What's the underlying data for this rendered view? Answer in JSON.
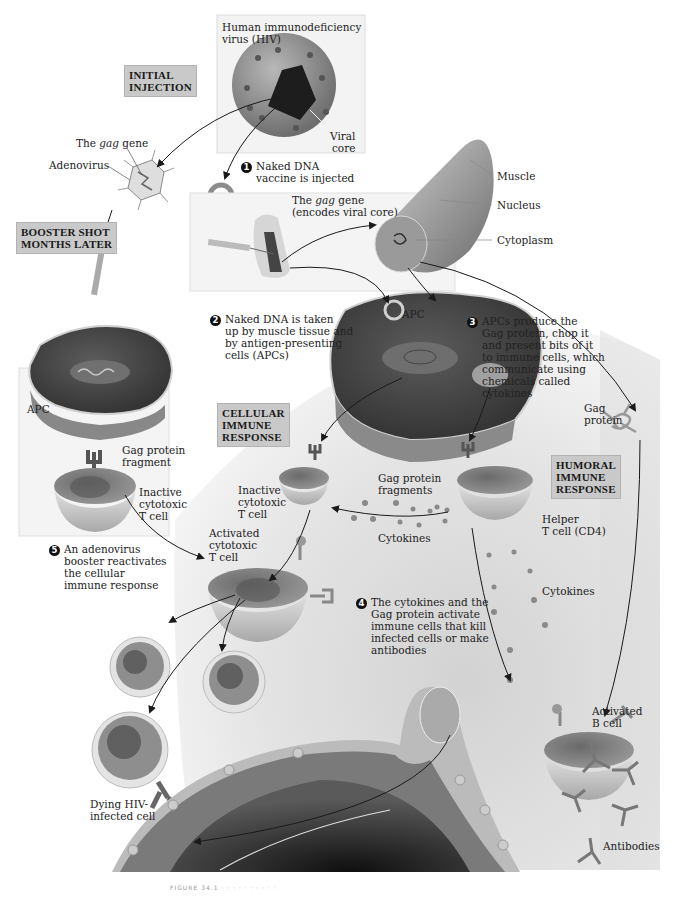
{
  "figure": {
    "stage_boxes": {
      "initial_injection": "INITIAL\nINJECTION",
      "booster_shot": "BOOSTER SHOT\nMONTHS LATER",
      "cellular_response": "CELLULAR\nIMMUNE\nRESPONSE",
      "humoral_response": "HUMORAL\nIMMUNE\nRESPONSE"
    },
    "steps": [
      {
        "number": "1",
        "text": "Naked DNA\nvaccine is injected"
      },
      {
        "number": "2",
        "text": "Naked DNA is taken\nup by muscle tissue and\nby antigen-presenting\ncells (APCs)"
      },
      {
        "number": "3",
        "text": "APCs produce the\n    Gag protein, chop it\n      and present bits of it\n    to immune cells, which\ncommunicate using\nchemicals called\ncytokines"
      },
      {
        "number": "4",
        "text": "The cytokines and the\nGag protein activate\nimmune cells that kill\ninfected cells or make\nantibodies"
      },
      {
        "number": "5",
        "text": "An adenovirus\nbooster reactivates\nthe cellular\nimmune response"
      }
    ],
    "labels": {
      "hiv_line1": "Human immunodeficiency",
      "hiv_line2": "virus (HIV)",
      "viral_core_line1": "Viral",
      "viral_core_line2": "core",
      "gag_gene_prefix": "The ",
      "gag_gene_italic": "gag",
      "gag_gene_suffix": " gene",
      "adenovirus": "Adenovirus",
      "gag_encodes_prefix": "The ",
      "gag_encodes_italic": "gag",
      "gag_encodes_suffix": " gene",
      "gag_encodes_line2": "(encodes viral core)",
      "muscle": "Muscle",
      "nucleus": "Nucleus",
      "cytoplasm": "Cytoplasm",
      "apc_top": "APC",
      "apc_left": "APC",
      "gag_fragment_line1": "Gag protein",
      "gag_fragment_line2": "fragment",
      "inactive_t_left_1": "Inactive",
      "inactive_t_left_2": "cytotoxic",
      "inactive_t_left_3": "T cell",
      "inactive_t_mid_1": "Inactive",
      "inactive_t_mid_2": "cytotoxic",
      "inactive_t_mid_3": "T cell",
      "gag_fragments_line1": "Gag protein",
      "gag_fragments_line2": "fragments",
      "gag_protein_line1": "Gag",
      "gag_protein_line2": "protein",
      "activated_t_1": "Activated",
      "activated_t_2": "cytotoxic",
      "activated_t_3": "T cell",
      "cytokines_left": "Cytokines",
      "cytokines_right": "Cytokines",
      "helper_t_1": "Helper",
      "helper_t_2": "T cell (CD4)",
      "activated_b_1": "Activated",
      "activated_b_2": "B cell",
      "dying_cell_1": "Dying HIV-",
      "dying_cell_2": "infected cell",
      "antibodies": "Antibodies"
    },
    "caption": "FIGURE 34.1  ·  ·  ·  ·  ·  ·  ·  ·  ·  ·",
    "colors": {
      "label_box_bg": "#c9c9c9",
      "cell_dark": "#4a4a4a",
      "cell_mid": "#8a8a8a",
      "cell_light": "#d6d6d6",
      "arrow": "#1a1a1a",
      "background_cloud": "#d9d9d9"
    }
  }
}
